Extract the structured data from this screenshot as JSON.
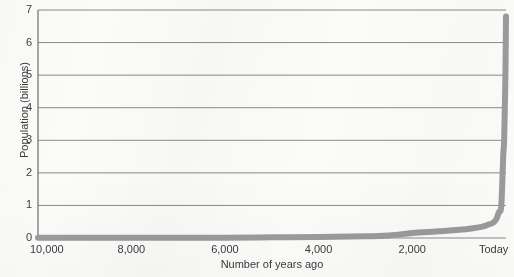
{
  "chart_data": {
    "type": "line",
    "title": "",
    "xlabel": "Number of years ago",
    "ylabel": "Population (billions)",
    "xtick_labels": [
      "10,000",
      "8,000",
      "6,000",
      "4,000",
      "2,000",
      "Today"
    ],
    "xtick_values": [
      10000,
      8000,
      6000,
      4000,
      2000,
      0
    ],
    "ytick_labels": [
      "0",
      "1",
      "2",
      "3",
      "4",
      "5",
      "6",
      "7"
    ],
    "ytick_values": [
      0,
      1,
      2,
      3,
      4,
      5,
      6,
      7
    ],
    "xlim": [
      10000,
      0
    ],
    "ylim": [
      0,
      7
    ],
    "x_axis_inverted": true,
    "grid": "horizontal",
    "legend": "none",
    "series": [
      {
        "name": "World population",
        "x": [
          10000,
          9000,
          8000,
          7000,
          6000,
          5000,
          4000,
          3000,
          2500,
          2000,
          1500,
          1000,
          700,
          500,
          400,
          300,
          250,
          200,
          150,
          100,
          60,
          40,
          20,
          10,
          0
        ],
        "values": [
          0.004,
          0.005,
          0.006,
          0.008,
          0.01,
          0.02,
          0.03,
          0.05,
          0.08,
          0.15,
          0.2,
          0.25,
          0.3,
          0.35,
          0.4,
          0.45,
          0.5,
          0.6,
          0.8,
          1.0,
          2.5,
          3.0,
          4.4,
          5.3,
          6.8
        ]
      }
    ],
    "line_color": "#9b9b9b",
    "grid_color": "#8a8a8a",
    "axis_color": "#6e6e6e",
    "line_width": 6
  },
  "geometry": {
    "plot_left": 38,
    "plot_right": 506,
    "plot_top": 10,
    "plot_bottom": 238
  }
}
